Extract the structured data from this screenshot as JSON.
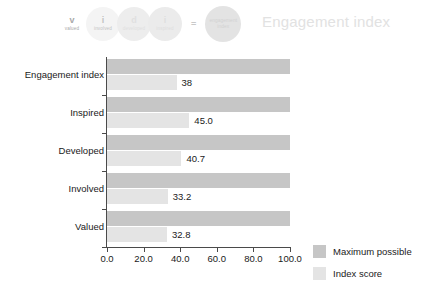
{
  "header": {
    "title": "Engagement index",
    "equals_symbol": "=",
    "components": [
      {
        "letter": "v",
        "word": "valued"
      },
      {
        "letter": "i",
        "word": "involved"
      },
      {
        "letter": "d",
        "word": "developed"
      },
      {
        "letter": "i",
        "word": "inspired"
      }
    ],
    "result": {
      "line1": "engagement",
      "line2": "index"
    }
  },
  "chart_data": {
    "type": "bar",
    "orientation": "horizontal",
    "title": "",
    "xlabel": "",
    "ylabel": "",
    "xlim": [
      0,
      100
    ],
    "grid": false,
    "legend_position": "right",
    "categories": [
      "Engagement index",
      "Inspired",
      "Developed",
      "Involved",
      "Valued"
    ],
    "series": [
      {
        "name": "Maximum possible",
        "color": "#c6c6c6",
        "values": [
          100.0,
          100.0,
          100.0,
          100.0,
          100.0
        ],
        "labels": [
          "",
          "",
          "",
          "",
          ""
        ]
      },
      {
        "name": "Index score",
        "color": "#e4e4e4",
        "values": [
          38.0,
          45.0,
          40.7,
          33.2,
          32.8
        ],
        "labels": [
          "38",
          "45.0",
          "40.7",
          "33.2",
          "32.8"
        ]
      }
    ],
    "xticks": [
      0,
      20,
      40,
      60,
      80,
      100
    ],
    "xticklabels": [
      "0.0",
      "20.0",
      "40.0",
      "60.0",
      "80.0",
      "100.0"
    ]
  },
  "legend": {
    "items": [
      {
        "label": "Maximum possible",
        "color": "#c6c6c6"
      },
      {
        "label": "Index score",
        "color": "#e4e4e4"
      }
    ]
  }
}
